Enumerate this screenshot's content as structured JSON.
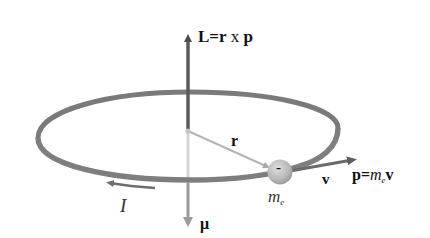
{
  "diagram": {
    "colors": {
      "loop": "#7a7a7a",
      "loop_highlight": "#8c8c8c",
      "axis_up": "#5a5a5a",
      "axis_down": "#c8c8c8",
      "mu_arrow": "#9a9a9a",
      "radius": "#b0b0b0",
      "electron": "#bdbdbd",
      "momentum_arrow": "#6a6a6a",
      "current_arrow": "#6e6e6e"
    },
    "labels": {
      "angular_momentum": {
        "main": "L=r",
        "op": " x ",
        "end": "p"
      },
      "radius": "r",
      "electron_charge": "-",
      "electron_mass": {
        "base": "m",
        "sub": "e"
      },
      "velocity": "v",
      "momentum": {
        "left": "p=",
        "m": "m",
        "sub": "e",
        "right": "v"
      },
      "current": "I",
      "magnetic_moment": "μ"
    },
    "elements": [
      {
        "name": "current-loop",
        "type": "ellipse",
        "cx": 188,
        "cy": 130,
        "rx": 150,
        "ry": 36
      },
      {
        "name": "angular-momentum-vector",
        "direction": "up",
        "from": [
          188,
          130
        ],
        "to": [
          188,
          30
        ]
      },
      {
        "name": "magnetic-moment-vector",
        "direction": "down",
        "from": [
          188,
          130
        ],
        "to": [
          188,
          230
        ]
      },
      {
        "name": "radius-vector",
        "from": [
          188,
          130
        ],
        "to": [
          270,
          168
        ]
      },
      {
        "name": "electron",
        "cx": 280,
        "cy": 172,
        "r": 12
      },
      {
        "name": "momentum-vector",
        "from": [
          292,
          170
        ],
        "to": [
          360,
          158
        ]
      },
      {
        "name": "current-direction-arrow",
        "direction": "left",
        "from": [
          155,
          188
        ],
        "to": [
          105,
          184
        ]
      }
    ]
  }
}
